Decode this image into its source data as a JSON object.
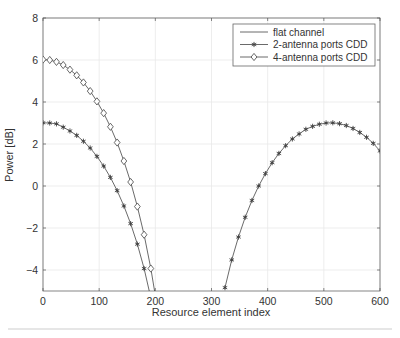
{
  "chart_data": {
    "type": "line",
    "title": "",
    "xlabel": "Resource element index",
    "ylabel": "Power [dB]",
    "xlim": [
      0,
      600
    ],
    "ylim": [
      -5,
      8
    ],
    "xticks": [
      0,
      100,
      200,
      300,
      400,
      500,
      600
    ],
    "yticks": [
      -4,
      -2,
      0,
      2,
      4,
      6,
      8
    ],
    "ytick_labels": [
      "−4",
      "−2",
      "0",
      "2",
      "4",
      "6",
      "8"
    ],
    "grid": true,
    "legend_position": "upper right",
    "series": [
      {
        "name": "flat channel",
        "marker": "none",
        "x": [
          0,
          600
        ],
        "y": [
          0,
          0
        ]
      },
      {
        "name": "2-antenna ports CDD",
        "marker": "asterisk",
        "x": [
          0,
          12,
          24,
          36,
          48,
          60,
          72,
          84,
          96,
          108,
          120,
          132,
          144,
          156,
          168,
          180,
          192,
          324,
          336,
          348,
          360,
          372,
          384,
          396,
          408,
          420,
          432,
          444,
          456,
          468,
          480,
          492,
          504,
          516,
          528,
          540,
          552,
          564,
          576,
          588,
          600
        ],
        "y": [
          3.01,
          3.0,
          2.96,
          2.8,
          2.62,
          2.41,
          2.13,
          1.81,
          1.41,
          0.95,
          0.41,
          -0.22,
          -0.95,
          -1.79,
          -2.77,
          -3.93,
          -5.33,
          -4.84,
          -3.52,
          -2.43,
          -1.49,
          -0.69,
          0.0,
          0.59,
          1.11,
          1.55,
          1.92,
          2.24,
          2.48,
          2.7,
          2.84,
          2.94,
          3.0,
          3.01,
          2.97,
          2.88,
          2.74,
          2.55,
          2.32,
          2.03,
          1.67
        ]
      },
      {
        "name": "4-antenna ports CDD",
        "marker": "diamond",
        "x": [
          0,
          12,
          24,
          36,
          48,
          60,
          72,
          84,
          96,
          108,
          120,
          132,
          144,
          156,
          168,
          180,
          192,
          204
        ],
        "y": [
          6.02,
          6.0,
          5.91,
          5.76,
          5.54,
          5.27,
          4.93,
          4.52,
          4.03,
          3.47,
          2.82,
          2.07,
          1.19,
          0.19,
          -0.98,
          -2.32,
          -3.93,
          -5.86
        ]
      }
    ]
  },
  "colors": {
    "axis": "#555555",
    "grid": "#e8e8e8",
    "line": "#444444",
    "text": "#333333"
  }
}
